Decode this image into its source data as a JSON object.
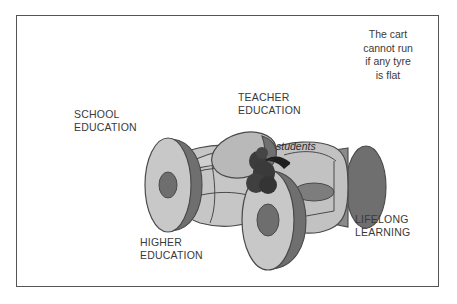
{
  "figure": {
    "type": "conceptual-diagram",
    "caption": "The cart\ncannot run\nif any tyre\nis flat",
    "labels": {
      "school": "SCHOOL\nEDUCATION",
      "teacher": "TEACHER\nEDUCATION",
      "higher": "HIGHER\nEDUCATION",
      "lifelong": "LIFELONG\nLEARNING",
      "students": "students"
    },
    "colors": {
      "frame": "#555555",
      "text": "#3a3a3a",
      "wheel_face": "#c8c8c8",
      "wheel_rim": "#7b7b7b",
      "wheel_hub": "#6e6e6e",
      "body": "#c2c2c2",
      "outline": "#4a4a4a",
      "students_cluster": "#3c3c3c",
      "background": "#ffffff"
    }
  }
}
